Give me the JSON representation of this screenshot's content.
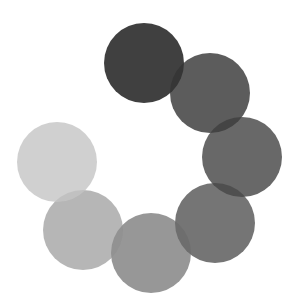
{
  "spinner": {
    "label": "loading-spinner",
    "diameter": 80,
    "dots": [
      {
        "cx": 144,
        "cy": 63,
        "color": "#262626",
        "opacity": 0.88
      },
      {
        "cx": 210,
        "cy": 93,
        "color": "#333333",
        "opacity": 0.8
      },
      {
        "cx": 242,
        "cy": 157,
        "color": "#3d3d3d",
        "opacity": 0.78
      },
      {
        "cx": 215,
        "cy": 223,
        "color": "#474747",
        "opacity": 0.75
      },
      {
        "cx": 151,
        "cy": 253,
        "color": "#6b6b6b",
        "opacity": 0.7
      },
      {
        "cx": 83,
        "cy": 230,
        "color": "#8f8f8f",
        "opacity": 0.65
      },
      {
        "cx": 57,
        "cy": 162,
        "color": "#c4c4c4",
        "opacity": 0.8
      }
    ]
  }
}
